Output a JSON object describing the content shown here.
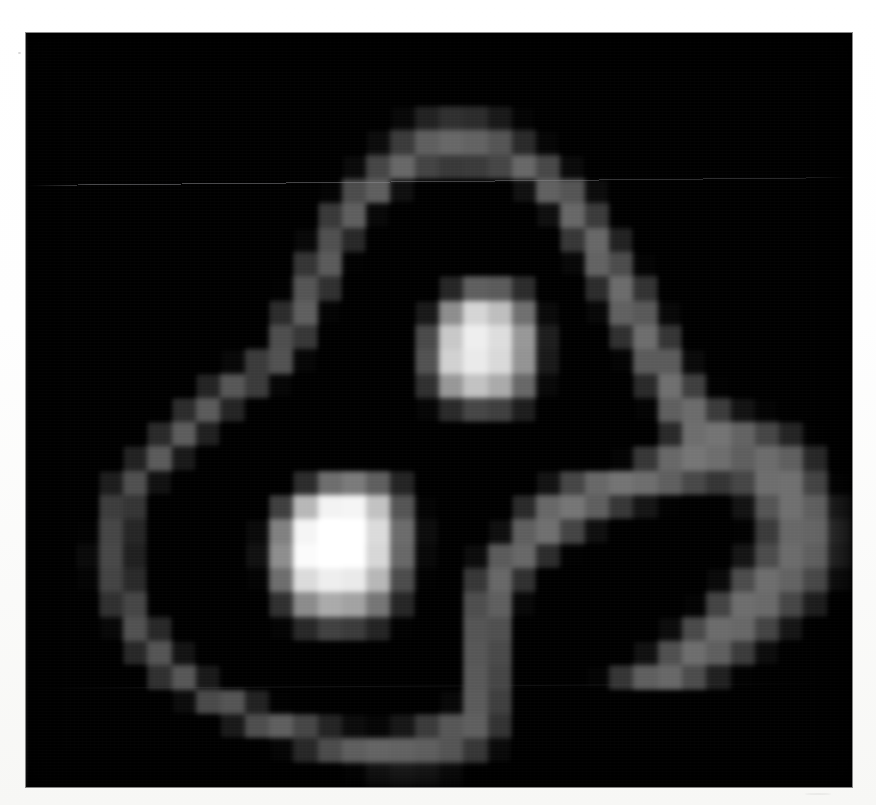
{
  "figure": {
    "caption": "Low-resolution grayscale image: teardrop-shaped contour loop with two bright compact nodes and a fainter right lobe",
    "background_color": "#000000",
    "page_color": "#ffffff",
    "frame": {
      "left": 26,
      "top": 33,
      "width": 826,
      "height": 754
    }
  },
  "colors": {
    "min_color": "#000000",
    "max_color": "#ffffff",
    "paper": "#ffffff",
    "frame_border": "#282828"
  },
  "artifacts": {
    "scan_line_top_label": "horizontal scan line",
    "scan_line_lower_label": "faint lower scan line",
    "grain_label": "print halftone grain"
  },
  "chart_data": {
    "type": "heatmap",
    "subtitle": "",
    "xlabel": "",
    "ylabel": "",
    "colormap": "gray",
    "grid": false,
    "legend": "none",
    "cols": 34,
    "rows": 31,
    "vmin": 0,
    "vmax": 255,
    "xlim": [
      0,
      34
    ],
    "ylim": [
      0,
      31
    ],
    "xticklabels": [],
    "yticklabels": [],
    "annotations": [
      {
        "name": "upper-bright-node",
        "col": 18,
        "row": 11,
        "peak_value": 232
      },
      {
        "name": "lower-left-bright-node",
        "col": 12,
        "row": 20,
        "peak_value": 250
      },
      {
        "name": "right-faint-lobe",
        "col": 28,
        "row": 20,
        "peak_value": 120
      },
      {
        "name": "teardrop-contour-loop",
        "col": 17,
        "row": 16,
        "peak_value": 150
      }
    ],
    "values": [
      [
        0,
        0,
        0,
        0,
        0,
        0,
        0,
        0,
        0,
        0,
        0,
        0,
        0,
        0,
        0,
        0,
        0,
        0,
        0,
        0,
        0,
        0,
        0,
        0,
        0,
        0,
        0,
        0,
        0,
        0,
        0,
        0,
        0,
        0
      ],
      [
        0,
        0,
        0,
        0,
        0,
        0,
        0,
        0,
        0,
        0,
        0,
        0,
        0,
        0,
        0,
        0,
        0,
        0,
        0,
        0,
        0,
        0,
        0,
        0,
        0,
        0,
        0,
        0,
        0,
        0,
        0,
        0,
        0,
        0
      ],
      [
        0,
        0,
        0,
        0,
        0,
        0,
        0,
        0,
        0,
        0,
        0,
        0,
        0,
        0,
        0,
        0,
        0,
        0,
        0,
        0,
        0,
        0,
        0,
        0,
        0,
        0,
        0,
        0,
        0,
        0,
        0,
        0,
        0,
        0
      ],
      [
        0,
        0,
        0,
        0,
        0,
        0,
        0,
        0,
        0,
        0,
        0,
        0,
        0,
        0,
        0,
        14,
        38,
        52,
        48,
        30,
        10,
        0,
        0,
        0,
        0,
        0,
        0,
        0,
        0,
        0,
        0,
        0,
        0,
        0
      ],
      [
        0,
        0,
        0,
        0,
        0,
        0,
        0,
        0,
        0,
        0,
        0,
        0,
        0,
        0,
        18,
        62,
        96,
        104,
        100,
        86,
        46,
        12,
        0,
        0,
        0,
        0,
        0,
        0,
        0,
        0,
        0,
        0,
        0,
        0
      ],
      [
        0,
        0,
        0,
        0,
        0,
        0,
        0,
        0,
        0,
        0,
        0,
        0,
        0,
        16,
        72,
        104,
        70,
        60,
        62,
        72,
        104,
        74,
        16,
        0,
        0,
        0,
        0,
        0,
        0,
        0,
        0,
        0,
        0,
        0
      ],
      [
        0,
        0,
        0,
        0,
        0,
        0,
        0,
        0,
        0,
        0,
        0,
        0,
        10,
        78,
        96,
        20,
        0,
        0,
        0,
        0,
        22,
        98,
        86,
        18,
        0,
        0,
        0,
        0,
        0,
        0,
        0,
        0,
        0,
        0
      ],
      [
        0,
        0,
        0,
        0,
        0,
        0,
        0,
        0,
        0,
        0,
        0,
        0,
        60,
        96,
        14,
        0,
        0,
        0,
        0,
        0,
        0,
        20,
        104,
        62,
        6,
        0,
        0,
        0,
        0,
        0,
        0,
        0,
        0,
        0
      ],
      [
        0,
        0,
        0,
        0,
        0,
        0,
        0,
        0,
        0,
        0,
        0,
        14,
        82,
        44,
        0,
        0,
        0,
        0,
        0,
        0,
        0,
        0,
        58,
        104,
        38,
        0,
        0,
        0,
        0,
        0,
        0,
        0,
        0,
        0
      ],
      [
        0,
        0,
        0,
        0,
        0,
        0,
        0,
        0,
        0,
        0,
        0,
        56,
        92,
        8,
        0,
        0,
        0,
        0,
        0,
        0,
        0,
        0,
        14,
        100,
        78,
        10,
        0,
        0,
        0,
        0,
        0,
        0,
        0,
        0
      ],
      [
        0,
        0,
        0,
        0,
        0,
        0,
        0,
        0,
        0,
        0,
        8,
        86,
        52,
        0,
        0,
        0,
        0,
        42,
        96,
        92,
        48,
        0,
        0,
        48,
        108,
        54,
        0,
        0,
        0,
        0,
        0,
        0,
        0,
        0
      ],
      [
        0,
        0,
        0,
        0,
        0,
        0,
        0,
        0,
        0,
        0,
        48,
        96,
        10,
        0,
        0,
        0,
        30,
        140,
        208,
        186,
        112,
        16,
        0,
        14,
        98,
        90,
        14,
        0,
        0,
        0,
        0,
        0,
        0,
        0
      ],
      [
        0,
        0,
        0,
        0,
        0,
        0,
        0,
        0,
        0,
        6,
        80,
        58,
        0,
        0,
        0,
        0,
        76,
        196,
        232,
        216,
        150,
        34,
        0,
        0,
        52,
        110,
        56,
        0,
        0,
        0,
        0,
        0,
        0,
        0
      ],
      [
        0,
        0,
        0,
        0,
        0,
        0,
        0,
        0,
        14,
        62,
        84,
        12,
        0,
        0,
        0,
        0,
        84,
        204,
        228,
        212,
        146,
        30,
        0,
        0,
        10,
        92,
        92,
        16,
        0,
        0,
        0,
        0,
        0,
        0
      ],
      [
        0,
        0,
        0,
        0,
        0,
        0,
        0,
        40,
        88,
        62,
        12,
        0,
        0,
        0,
        0,
        0,
        52,
        150,
        190,
        168,
        104,
        14,
        0,
        0,
        0,
        46,
        112,
        66,
        8,
        0,
        0,
        0,
        0,
        0
      ],
      [
        0,
        0,
        0,
        0,
        0,
        0,
        48,
        92,
        40,
        4,
        0,
        0,
        0,
        0,
        0,
        0,
        12,
        46,
        72,
        66,
        34,
        0,
        0,
        0,
        0,
        10,
        96,
        108,
        62,
        24,
        10,
        0,
        0,
        0
      ],
      [
        0,
        0,
        0,
        0,
        0,
        46,
        94,
        36,
        0,
        0,
        0,
        0,
        0,
        0,
        0,
        0,
        0,
        0,
        0,
        0,
        0,
        0,
        0,
        0,
        0,
        0,
        46,
        110,
        116,
        100,
        72,
        40,
        8,
        0
      ],
      [
        0,
        0,
        0,
        0,
        38,
        92,
        30,
        0,
        0,
        0,
        0,
        0,
        0,
        0,
        0,
        0,
        0,
        0,
        0,
        0,
        0,
        0,
        0,
        0,
        10,
        58,
        104,
        118,
        110,
        96,
        108,
        96,
        44,
        0
      ],
      [
        0,
        0,
        0,
        34,
        82,
        22,
        0,
        0,
        0,
        0,
        0,
        48,
        110,
        122,
        96,
        40,
        0,
        0,
        0,
        0,
        0,
        24,
        72,
        104,
        116,
        110,
        96,
        74,
        56,
        72,
        110,
        112,
        70,
        10
      ],
      [
        0,
        0,
        0,
        64,
        56,
        0,
        0,
        0,
        0,
        0,
        66,
        180,
        236,
        238,
        190,
        86,
        10,
        0,
        0,
        0,
        46,
        104,
        118,
        96,
        58,
        26,
        8,
        0,
        0,
        24,
        86,
        112,
        96,
        34
      ],
      [
        0,
        0,
        8,
        72,
        42,
        0,
        0,
        0,
        0,
        16,
        128,
        238,
        252,
        250,
        214,
        108,
        18,
        0,
        0,
        20,
        96,
        112,
        70,
        20,
        0,
        0,
        0,
        0,
        0,
        8,
        62,
        104,
        102,
        48
      ],
      [
        0,
        0,
        16,
        74,
        36,
        0,
        0,
        0,
        0,
        22,
        140,
        244,
        250,
        248,
        210,
        104,
        14,
        0,
        18,
        92,
        104,
        48,
        8,
        0,
        0,
        0,
        0,
        0,
        0,
        26,
        78,
        108,
        96,
        42
      ],
      [
        0,
        0,
        10,
        70,
        46,
        0,
        0,
        0,
        0,
        10,
        110,
        214,
        232,
        228,
        180,
        78,
        8,
        0,
        58,
        104,
        52,
        0,
        0,
        0,
        0,
        0,
        0,
        0,
        16,
        78,
        110,
        100,
        74,
        20
      ],
      [
        0,
        0,
        0,
        52,
        72,
        6,
        0,
        0,
        0,
        0,
        52,
        138,
        168,
        160,
        118,
        42,
        0,
        0,
        80,
        96,
        14,
        0,
        0,
        0,
        0,
        0,
        0,
        10,
        70,
        110,
        106,
        72,
        34,
        0
      ],
      [
        0,
        0,
        0,
        14,
        84,
        44,
        0,
        0,
        0,
        0,
        10,
        44,
        68,
        62,
        40,
        8,
        0,
        0,
        86,
        82,
        0,
        0,
        0,
        0,
        0,
        0,
        18,
        76,
        108,
        104,
        70,
        26,
        0,
        0
      ],
      [
        0,
        0,
        0,
        0,
        44,
        86,
        24,
        0,
        0,
        0,
        0,
        0,
        0,
        0,
        0,
        0,
        0,
        0,
        88,
        76,
        0,
        0,
        0,
        0,
        0,
        22,
        82,
        110,
        96,
        62,
        18,
        0,
        0,
        0
      ],
      [
        0,
        0,
        0,
        0,
        0,
        52,
        88,
        30,
        4,
        0,
        0,
        0,
        0,
        0,
        0,
        0,
        0,
        0,
        90,
        72,
        0,
        0,
        0,
        10,
        56,
        96,
        104,
        78,
        36,
        8,
        0,
        0,
        0,
        0
      ],
      [
        0,
        0,
        0,
        0,
        0,
        0,
        18,
        76,
        86,
        38,
        8,
        0,
        0,
        0,
        0,
        0,
        0,
        14,
        92,
        66,
        0,
        0,
        0,
        0,
        0,
        0,
        0,
        0,
        0,
        0,
        0,
        0,
        0,
        0
      ],
      [
        0,
        0,
        0,
        0,
        0,
        0,
        0,
        0,
        30,
        80,
        96,
        72,
        40,
        18,
        12,
        28,
        62,
        88,
        96,
        54,
        0,
        0,
        0,
        0,
        0,
        0,
        0,
        0,
        0,
        0,
        0,
        0,
        0,
        0
      ],
      [
        0,
        0,
        0,
        0,
        0,
        0,
        0,
        0,
        0,
        0,
        12,
        44,
        78,
        96,
        102,
        100,
        96,
        86,
        58,
        16,
        0,
        0,
        0,
        0,
        0,
        0,
        0,
        0,
        0,
        0,
        0,
        0,
        0,
        0
      ],
      [
        0,
        0,
        0,
        0,
        0,
        0,
        0,
        0,
        0,
        0,
        0,
        0,
        0,
        10,
        26,
        34,
        30,
        18,
        6,
        0,
        0,
        0,
        0,
        0,
        0,
        0,
        0,
        0,
        0,
        0,
        0,
        0,
        0,
        0
      ]
    ]
  }
}
